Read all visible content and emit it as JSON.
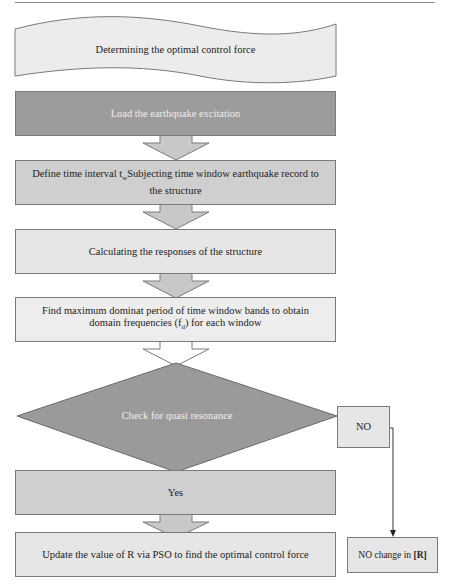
{
  "diagram": {
    "type": "flowchart",
    "start": {
      "label": "Determining the optimal control force"
    },
    "steps": [
      {
        "id": "load",
        "label": "Load the earthquake excitation"
      },
      {
        "id": "define",
        "label_pre": "Define time interval t",
        "label_sub": "w",
        "label_post": "Subjecting time window earthquake record to the structure"
      },
      {
        "id": "calculate",
        "label": "Calculating  the responses of the structure"
      },
      {
        "id": "find",
        "label_pre": "Find maximum dominat period  of time window bands to obtain domain frequencies (f",
        "label_sub": "d",
        "label_post": ") for each window"
      }
    ],
    "decision": {
      "label": "Check for quasi resonance"
    },
    "branch_yes": {
      "label": "Yes",
      "next": "Update the value of R via PSO to find the optimal control force"
    },
    "branch_no": {
      "label": "NO",
      "next_pre": "NO change in ",
      "next_bold": "[R]"
    },
    "colors": {
      "dark_fill": "#9c9c9c",
      "light_fill": "#e6e6e6",
      "border": "#7a7a7a",
      "arrow_fill": "#cccccc"
    }
  }
}
